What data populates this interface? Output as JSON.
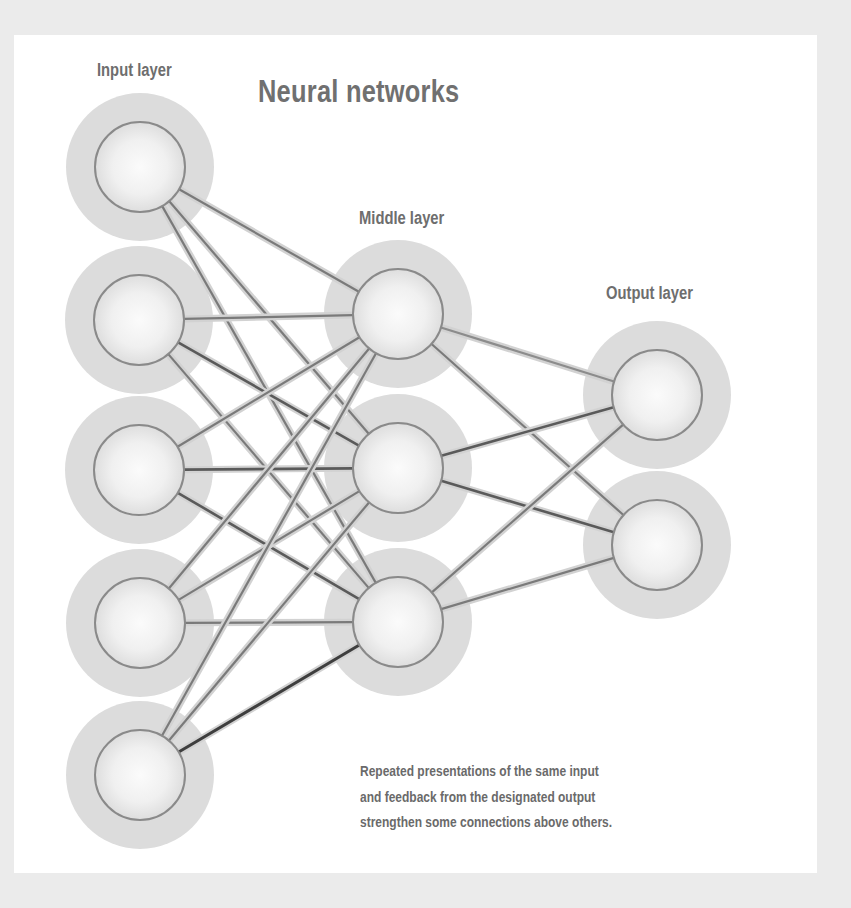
{
  "title": "Neural networks",
  "layers": {
    "input": {
      "label": "Input layer",
      "nodes": [
        {
          "x": 140,
          "y": 167
        },
        {
          "x": 139,
          "y": 320
        },
        {
          "x": 139,
          "y": 470
        },
        {
          "x": 140,
          "y": 623
        },
        {
          "x": 140,
          "y": 775
        }
      ]
    },
    "middle": {
      "label": "Middle layer",
      "nodes": [
        {
          "x": 398,
          "y": 314
        },
        {
          "x": 398,
          "y": 468
        },
        {
          "x": 398,
          "y": 622
        }
      ]
    },
    "output": {
      "label": "Output layer",
      "nodes": [
        {
          "x": 657,
          "y": 395
        },
        {
          "x": 657,
          "y": 545
        }
      ]
    }
  },
  "node_style": {
    "halo_radius": 74,
    "inner_radius": 45,
    "halo_color": "#dcdcdc",
    "stroke_color": "#8a8a8a"
  },
  "connections": [
    {
      "from": "input.0",
      "to": "middle.0",
      "strength": "normal"
    },
    {
      "from": "input.0",
      "to": "middle.1",
      "strength": "normal"
    },
    {
      "from": "input.0",
      "to": "middle.2",
      "strength": "normal"
    },
    {
      "from": "input.1",
      "to": "middle.0",
      "strength": "normal"
    },
    {
      "from": "input.1",
      "to": "middle.1",
      "strength": "strong"
    },
    {
      "from": "input.1",
      "to": "middle.2",
      "strength": "normal"
    },
    {
      "from": "input.2",
      "to": "middle.0",
      "strength": "normal"
    },
    {
      "from": "input.2",
      "to": "middle.1",
      "strength": "strong"
    },
    {
      "from": "input.2",
      "to": "middle.2",
      "strength": "strong"
    },
    {
      "from": "input.3",
      "to": "middle.0",
      "strength": "normal"
    },
    {
      "from": "input.3",
      "to": "middle.1",
      "strength": "normal"
    },
    {
      "from": "input.3",
      "to": "middle.2",
      "strength": "normal"
    },
    {
      "from": "input.4",
      "to": "middle.0",
      "strength": "normal"
    },
    {
      "from": "input.4",
      "to": "middle.1",
      "strength": "normal"
    },
    {
      "from": "input.4",
      "to": "middle.2",
      "strength": "strongest"
    },
    {
      "from": "middle.0",
      "to": "output.0",
      "strength": "weak"
    },
    {
      "from": "middle.0",
      "to": "output.1",
      "strength": "normal"
    },
    {
      "from": "middle.1",
      "to": "output.0",
      "strength": "strong"
    },
    {
      "from": "middle.1",
      "to": "output.1",
      "strength": "strong"
    },
    {
      "from": "middle.2",
      "to": "output.0",
      "strength": "normal"
    },
    {
      "from": "middle.2",
      "to": "output.1",
      "strength": "normal"
    }
  ],
  "line_colors": {
    "weak": "#8c8c8c",
    "normal": "#7a7a7a",
    "strong": "#5a5a5a",
    "strongest": "#3e3e3e",
    "halo": "#d2d2d2"
  },
  "caption": {
    "lines": [
      "Repeated presentations of the same input",
      "and feedback from the designated output",
      "strengthen some connections above others."
    ]
  }
}
